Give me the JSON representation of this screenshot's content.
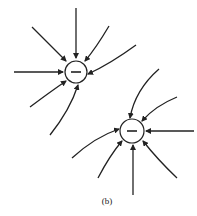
{
  "figure": {
    "caption": "(b)",
    "line_color": "#222222",
    "charges": [
      {
        "sign": "−",
        "label": "negative charge 1",
        "cx": 76,
        "cy": 72,
        "r": 11
      },
      {
        "sign": "−",
        "label": "negative charge 2",
        "cx": 132,
        "cy": 131,
        "r": 12
      }
    ]
  }
}
